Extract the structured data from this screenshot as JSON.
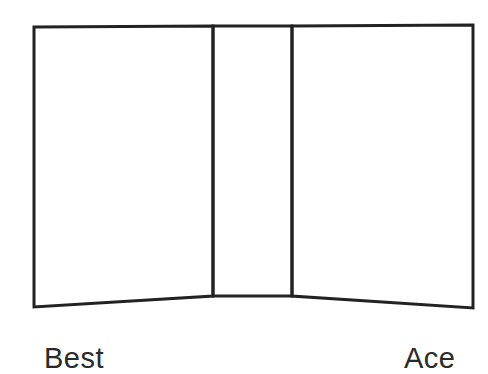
{
  "diagram": {
    "stroke_color": "#222222",
    "background": "#ffffff",
    "panels": [
      {
        "name": "left-panel",
        "points": [
          [
            34,
            27
          ],
          [
            213,
            26
          ],
          [
            213,
            296
          ],
          [
            34,
            307
          ]
        ]
      },
      {
        "name": "spine-panel",
        "points": [
          [
            213,
            26
          ],
          [
            292,
            26
          ],
          [
            292,
            296
          ],
          [
            213,
            296
          ]
        ]
      },
      {
        "name": "right-panel",
        "points": [
          [
            292,
            26
          ],
          [
            473,
            25
          ],
          [
            473,
            308
          ],
          [
            292,
            296
          ]
        ]
      }
    ],
    "labels": {
      "left": "Best",
      "right": "Ace"
    }
  }
}
